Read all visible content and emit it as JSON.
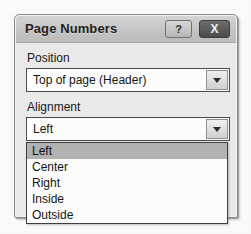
{
  "dialog": {
    "title": "Page Numbers",
    "help_button_label": "?",
    "close_button_label": "X",
    "help_icon": "question-mark-icon",
    "close_icon": "close-x-icon"
  },
  "fields": {
    "position": {
      "label": "Position",
      "value": "Top of page (Header)",
      "arrow_icon": "chevron-down-icon"
    },
    "alignment": {
      "label": "Alignment",
      "value": "Left",
      "arrow_icon": "chevron-down-icon"
    }
  },
  "alignment_dropdown": {
    "open": true,
    "selected_index": 0,
    "options": [
      "Left",
      "Center",
      "Right",
      "Inside",
      "Outside"
    ]
  },
  "colors": {
    "titlebar": "#c8c8c8",
    "dialog_body": "#ececec",
    "selection_highlight": "#b4b4b4",
    "field_background": "#ffffff",
    "border": "#4a4a4a"
  }
}
